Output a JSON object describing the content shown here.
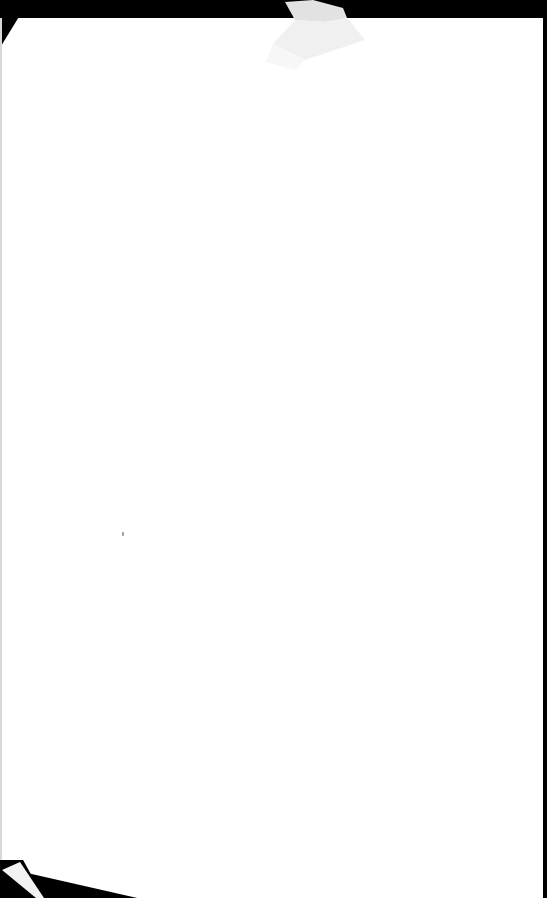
{
  "document": {
    "type": "scanned blank page",
    "text_content": "",
    "colors": {
      "paper": "#ffffff",
      "scanner_background": "#000000",
      "fold_shade": "#e6e6e6"
    },
    "features": [
      "folded-corner-top-center",
      "folded-corner-bottom-left",
      "small-speck-mark"
    ]
  }
}
